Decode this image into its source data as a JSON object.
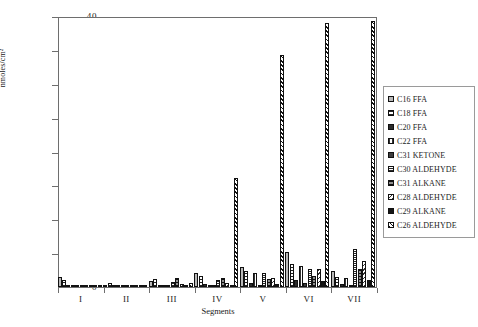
{
  "chart_data": {
    "type": "bar",
    "title": "",
    "xlabel": "Segments",
    "ylabel": "nmoles/cm²",
    "ylim": [
      0,
      40
    ],
    "yticks": [
      0,
      5,
      10,
      15,
      20,
      25,
      30,
      35,
      40
    ],
    "grid": false,
    "legend_position": "right",
    "categories": [
      "I",
      "II",
      "III",
      "IV",
      "V",
      "VI",
      "VII"
    ],
    "series": [
      {
        "name": "C16 FFA",
        "pattern": "solid-light-gray",
        "values": [
          1.5,
          0.0,
          0.9,
          2.1,
          3.0,
          5.2,
          2.3
        ]
      },
      {
        "name": "C18 FFA",
        "pattern": "horizontal-lines",
        "values": [
          1.0,
          0.6,
          1.2,
          1.6,
          2.3,
          3.4,
          1.5
        ]
      },
      {
        "name": "C20 FFA",
        "pattern": "solid-dark",
        "values": [
          0.2,
          0.1,
          0.3,
          0.4,
          0.6,
          1.1,
          0.5
        ]
      },
      {
        "name": "C22 FFA",
        "pattern": "vertical-lines",
        "values": [
          0.2,
          0.1,
          0.2,
          0.3,
          2.0,
          3.1,
          1.3
        ]
      },
      {
        "name": "C31 KETONE",
        "pattern": "solid-dark-gray",
        "values": [
          0.1,
          0.0,
          0.1,
          0.2,
          0.3,
          0.6,
          0.3
        ]
      },
      {
        "name": "C30  ALDEHYDE",
        "pattern": "dense-horizontal",
        "values": [
          0.2,
          0.1,
          0.8,
          1.0,
          2.0,
          2.6,
          5.6
        ]
      },
      {
        "name": "C31 ALKANE",
        "pattern": "gray-horizontal",
        "values": [
          0.3,
          0.1,
          1.3,
          1.3,
          1.2,
          1.6,
          2.7
        ]
      },
      {
        "name": "C28  ALDEHYDE",
        "pattern": "diagonal-lines",
        "values": [
          0.1,
          0.1,
          0.5,
          0.6,
          1.4,
          2.6,
          3.9
        ]
      },
      {
        "name": "C29 ALKANE",
        "pattern": "solid-black",
        "values": [
          0.1,
          0.0,
          0.2,
          0.3,
          0.5,
          0.9,
          1.0
        ]
      },
      {
        "name": "C26 ALDEHYDE",
        "pattern": "diagonal-hatch",
        "values": [
          0.3,
          0.1,
          0.6,
          16.1,
          34.3,
          39.0,
          39.3
        ]
      }
    ]
  },
  "axes": {
    "y_title": "nmoles/cm²",
    "x_title": "Segments"
  }
}
